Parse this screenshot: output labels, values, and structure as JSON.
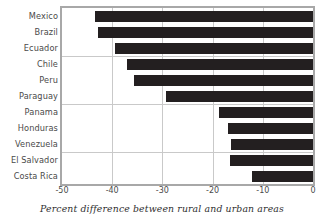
{
  "chart_data": {
    "type": "bar",
    "orientation": "horizontal",
    "title": "",
    "xlabel": "Percent difference between rural and urban areas",
    "ylabel": "",
    "categories": [
      "Mexico",
      "Brazil",
      "Ecuador",
      "Chile",
      "Peru",
      "Paraguay",
      "Panama",
      "Honduras",
      "Venezuela",
      "El Salvador",
      "Costa Rica"
    ],
    "values": [
      -43.5,
      -42.8,
      -39.5,
      -37.0,
      -35.7,
      -29.2,
      -18.8,
      -17.0,
      -16.3,
      -16.5,
      -12.2
    ],
    "xlim": [
      -50,
      0
    ],
    "xticks": [
      -50,
      -40,
      -30,
      -20,
      -10,
      0
    ],
    "xticklabels": [
      "-50",
      "-40",
      "-30",
      "-20",
      "-10",
      "0"
    ],
    "group_separators_after": [
      3,
      6,
      9
    ],
    "grid": "vertical-major-and-group-separators",
    "legend": null,
    "bar_color": "#231f20",
    "grid_color": "#c9c9c9",
    "frame_color": "#a8a8a8",
    "text_color": "#4a4a4a"
  }
}
